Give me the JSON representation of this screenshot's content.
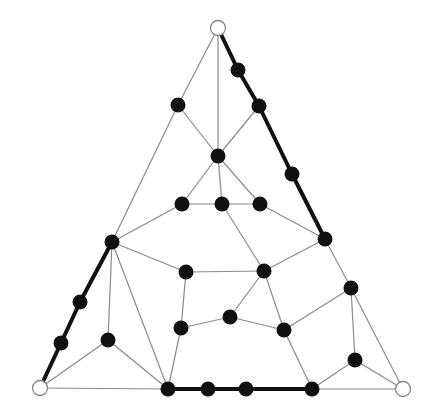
{
  "diagram": {
    "title": "",
    "colors": {
      "background": "#ffffff",
      "thin_edge": "#8a8a8a",
      "thick_edge": "#111111",
      "node_fill": "#111111",
      "corner_fill": "#ffffff"
    },
    "corners": [
      {
        "id": "T",
        "x": 218,
        "y": 28
      },
      {
        "id": "BL",
        "x": 40,
        "y": 388
      },
      {
        "id": "BR",
        "x": 403,
        "y": 389
      }
    ],
    "nodes": [
      {
        "id": "r1",
        "x": 238,
        "y": 70
      },
      {
        "id": "r2",
        "x": 259,
        "y": 106
      },
      {
        "id": "r3",
        "x": 292,
        "y": 174
      },
      {
        "id": "r4",
        "x": 325,
        "y": 239
      },
      {
        "id": "a",
        "x": 178,
        "y": 105
      },
      {
        "id": "c",
        "x": 218,
        "y": 156
      },
      {
        "id": "m1",
        "x": 182,
        "y": 204
      },
      {
        "id": "m2",
        "x": 222,
        "y": 204
      },
      {
        "id": "m3",
        "x": 260,
        "y": 204
      },
      {
        "id": "l1",
        "x": 112,
        "y": 242
      },
      {
        "id": "l2",
        "x": 80,
        "y": 302
      },
      {
        "id": "l3",
        "x": 61,
        "y": 343
      },
      {
        "id": "p1",
        "x": 186,
        "y": 272
      },
      {
        "id": "p2",
        "x": 264,
        "y": 271
      },
      {
        "id": "p3",
        "x": 181,
        "y": 328
      },
      {
        "id": "p4",
        "x": 230,
        "y": 317
      },
      {
        "id": "p5",
        "x": 284,
        "y": 330
      },
      {
        "id": "q1",
        "x": 108,
        "y": 340
      },
      {
        "id": "s1",
        "x": 351,
        "y": 288
      },
      {
        "id": "s2",
        "x": 355,
        "y": 360
      },
      {
        "id": "b1",
        "x": 168,
        "y": 389
      },
      {
        "id": "b2",
        "x": 208,
        "y": 389
      },
      {
        "id": "b3",
        "x": 246,
        "y": 389
      },
      {
        "id": "b4",
        "x": 312,
        "y": 389
      }
    ],
    "thick_edges": [
      [
        "T",
        "r1"
      ],
      [
        "r1",
        "r2"
      ],
      [
        "r2",
        "r3"
      ],
      [
        "r3",
        "r4"
      ],
      [
        "BL",
        "l3"
      ],
      [
        "l3",
        "l2"
      ],
      [
        "l2",
        "l1"
      ],
      [
        "b1",
        "b2"
      ],
      [
        "b2",
        "b3"
      ],
      [
        "b3",
        "b4"
      ]
    ],
    "thin_edges": [
      [
        "T",
        "a"
      ],
      [
        "a",
        "l1"
      ],
      [
        "T",
        "c"
      ],
      [
        "a",
        "c"
      ],
      [
        "r2",
        "c"
      ],
      [
        "c",
        "m1"
      ],
      [
        "c",
        "m2"
      ],
      [
        "c",
        "m3"
      ],
      [
        "m1",
        "m2"
      ],
      [
        "m2",
        "m3"
      ],
      [
        "m1",
        "l1"
      ],
      [
        "m2",
        "p2"
      ],
      [
        "m3",
        "r4"
      ],
      [
        "l1",
        "p1"
      ],
      [
        "l1",
        "q1"
      ],
      [
        "l1",
        "b1"
      ],
      [
        "BL",
        "q1"
      ],
      [
        "BL",
        "b1"
      ],
      [
        "q1",
        "b1"
      ],
      [
        "p1",
        "p2"
      ],
      [
        "p1",
        "p3"
      ],
      [
        "p3",
        "b1"
      ],
      [
        "p3",
        "p4"
      ],
      [
        "p4",
        "p2"
      ],
      [
        "p4",
        "p5"
      ],
      [
        "p2",
        "p5"
      ],
      [
        "p2",
        "r4"
      ],
      [
        "r4",
        "s1"
      ],
      [
        "s1",
        "p5"
      ],
      [
        "s1",
        "s2"
      ],
      [
        "s1",
        "BR"
      ],
      [
        "p5",
        "b4"
      ],
      [
        "s2",
        "b4"
      ],
      [
        "s2",
        "BR"
      ],
      [
        "b4",
        "BR"
      ]
    ]
  }
}
